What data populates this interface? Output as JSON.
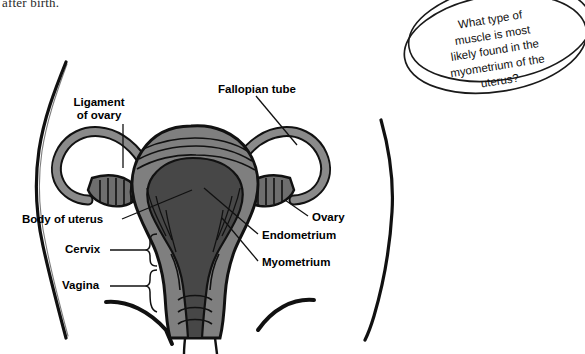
{
  "page": {
    "cut_off_text": "after birth.",
    "background_color": "#ffffff"
  },
  "question_bubble": {
    "name": "question-callout",
    "text": "What type of\nmuscle is most\nlikely found in the\nmyometrium of the\nuterus?",
    "shape": "hand-drawn-double-ellipse",
    "stroke_color": "#1a1a1a"
  },
  "diagram": {
    "body_outline_color": "#111111",
    "colors": {
      "myometrium": "#7f7f7f",
      "endometrium": "#474747",
      "tube_wall": "#8a8a8a",
      "outline": "#111111",
      "ovary_fill": "#6e6e6e",
      "fimbriae": "#e8e8e8"
    },
    "labels": [
      {
        "id": "ligament-of-ovary",
        "text": "Ligament\nof ovary",
        "x": 98,
        "y": 98,
        "align": "center"
      },
      {
        "id": "fallopian-tube",
        "text": "Fallopian tube",
        "x": 218,
        "y": 85,
        "align": "left"
      },
      {
        "id": "body-of-uterus",
        "text": "Body of uterus",
        "x": 22,
        "y": 214,
        "align": "left"
      },
      {
        "id": "cervix",
        "text": "Cervix",
        "x": 65,
        "y": 245,
        "align": "left"
      },
      {
        "id": "vagina",
        "text": "Vagina",
        "x": 62,
        "y": 281,
        "align": "left"
      },
      {
        "id": "ovary",
        "text": "Ovary",
        "x": 312,
        "y": 213,
        "align": "left"
      },
      {
        "id": "endometrium",
        "text": "Endometrium",
        "x": 262,
        "y": 232,
        "align": "left"
      },
      {
        "id": "myometrium",
        "text": "Myometrium",
        "x": 262,
        "y": 259,
        "align": "left"
      }
    ]
  }
}
